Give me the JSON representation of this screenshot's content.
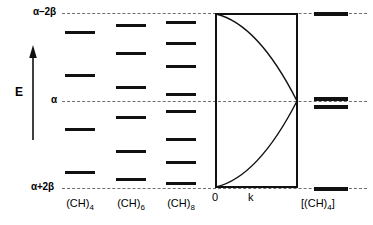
{
  "diagram": {
    "energy_axis": {
      "label": "E",
      "arrow_direction": "up",
      "arrow_name": "energy-axis-arrow"
    },
    "reference_levels": [
      {
        "id": "top",
        "label": "α−2β",
        "value": "alpha - 2 beta",
        "y": 13
      },
      {
        "id": "middle",
        "label": "α",
        "value": "alpha",
        "y": 101
      },
      {
        "id": "bottom",
        "label": "α+2β",
        "value": "alpha + 2 beta",
        "y": 188
      }
    ],
    "columns": [
      {
        "name": "ch4",
        "label": "(CH)",
        "subscript": "4",
        "n_levels": 4,
        "center_x": 80,
        "level_width": 30,
        "levels_y": [
          31,
          74,
          128,
          171
        ]
      },
      {
        "name": "ch6",
        "label": "(CH)",
        "subscript": "6",
        "n_levels": 6,
        "center_x": 131,
        "level_width": 30,
        "levels_y": [
          24,
          52,
          86,
          116,
          150,
          178
        ]
      },
      {
        "name": "ch8",
        "label": "(CH)",
        "subscript": "8",
        "n_levels": 8,
        "center_x": 181,
        "level_width": 30,
        "levels_y": [
          21,
          42,
          65,
          93,
          110,
          138,
          161,
          182
        ]
      }
    ],
    "band_diagram": {
      "name": "band-structure-box",
      "box": {
        "x": 215,
        "y": 13,
        "width": 83,
        "height": 175
      },
      "x_axis": {
        "origin_label": "0",
        "variable_label": "k"
      },
      "bands": [
        {
          "name": "valence-band",
          "start": "alpha + 2 beta at k=0",
          "end": "alpha at k=pi/a"
        },
        {
          "name": "conduction-band",
          "start": "alpha - 2 beta at k=0",
          "end": "alpha at k=pi/a"
        }
      ]
    },
    "polymer": {
      "name": "polyacetylene",
      "label_prefix": "[(CH)",
      "label_subscript": "4",
      "label_suffix": "]",
      "center_x": 331,
      "level_width": 34,
      "levels": [
        {
          "id": "upper-band-edge",
          "y": 13,
          "thick": true
        },
        {
          "id": "band-gap-upper",
          "y": 98,
          "thick": true
        },
        {
          "id": "band-gap-lower",
          "y": 105,
          "thick": true
        },
        {
          "id": "lower-band-edge",
          "y": 188,
          "thick": true
        }
      ]
    },
    "colors": {
      "line": "#111111",
      "dashed": "#6f6f6f",
      "background": "#ffffff"
    }
  }
}
